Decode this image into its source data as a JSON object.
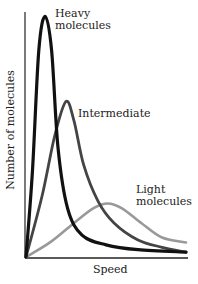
{
  "chart_data": {
    "type": "line",
    "title": "",
    "xlabel": "Speed",
    "ylabel": "Number of molecules",
    "grid": false,
    "legend": "inline labels",
    "xlim": [
      0,
      1
    ],
    "ylim": [
      0,
      1
    ],
    "series": [
      {
        "name": "Heavy molecules",
        "color": "#111111",
        "peak_x": 0.12,
        "peak_y": 0.99,
        "points": [
          [
            0,
            0
          ],
          [
            0.04,
            0.35
          ],
          [
            0.08,
            0.85
          ],
          [
            0.12,
            0.99
          ],
          [
            0.16,
            0.85
          ],
          [
            0.2,
            0.45
          ],
          [
            0.26,
            0.2
          ],
          [
            0.35,
            0.09
          ],
          [
            0.5,
            0.05
          ],
          [
            0.7,
            0.03
          ],
          [
            1.0,
            0.02
          ]
        ]
      },
      {
        "name": "Intermediate",
        "color": "#444444",
        "peak_x": 0.25,
        "peak_y": 0.64,
        "points": [
          [
            0,
            0
          ],
          [
            0.1,
            0.25
          ],
          [
            0.18,
            0.5
          ],
          [
            0.25,
            0.64
          ],
          [
            0.3,
            0.56
          ],
          [
            0.36,
            0.38
          ],
          [
            0.45,
            0.23
          ],
          [
            0.55,
            0.14
          ],
          [
            0.7,
            0.07
          ],
          [
            0.85,
            0.04
          ],
          [
            1.0,
            0.02
          ]
        ]
      },
      {
        "name": "Light molecules",
        "color": "#999999",
        "peak_x": 0.51,
        "peak_y": 0.22,
        "points": [
          [
            0,
            0
          ],
          [
            0.15,
            0.06
          ],
          [
            0.3,
            0.14
          ],
          [
            0.42,
            0.2
          ],
          [
            0.51,
            0.22
          ],
          [
            0.6,
            0.2
          ],
          [
            0.72,
            0.14
          ],
          [
            0.85,
            0.08
          ],
          [
            1.0,
            0.06
          ]
        ]
      }
    ],
    "annotations": [
      {
        "text_lines": [
          "Heavy",
          "molecules"
        ],
        "series": "Heavy molecules"
      },
      {
        "text_lines": [
          "Intermediate"
        ],
        "series": "Intermediate"
      },
      {
        "text_lines": [
          "Light",
          "molecules"
        ],
        "series": "Light molecules"
      }
    ]
  },
  "labels": {
    "heavy_1": "Heavy",
    "heavy_2": "molecules",
    "intermediate": "Intermediate",
    "light_1": "Light",
    "light_2": "molecules",
    "xlabel": "Speed",
    "ylabel": "Number of molecules"
  }
}
